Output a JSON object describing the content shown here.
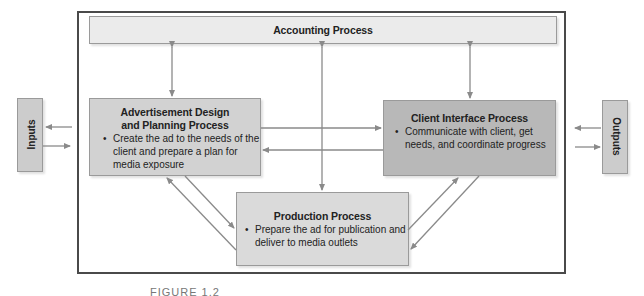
{
  "diagram": {
    "colors": {
      "frame": "#4a4a4a",
      "accounting_fill": "#ebebeb",
      "advertisement_fill": "#d2d2d2",
      "client_fill": "#b8b8b8",
      "production_fill": "#dadada",
      "io_fill": "#cccccc",
      "arrow": "#8a8a8a"
    },
    "inputs": {
      "label": "Inputs"
    },
    "outputs": {
      "label": "Outputs"
    },
    "accounting": {
      "title": "Accounting Process"
    },
    "advertisement": {
      "title_line1": "Advertisement Design",
      "title_line2": "and Planning Process",
      "bullet": "•",
      "lines": [
        "Create the ad to the needs of the",
        "client and prepare a plan for",
        "media exposure"
      ]
    },
    "client": {
      "title": "Client Interface Process",
      "bullet": "•",
      "lines": [
        "Communicate with client, get",
        "needs, and coordinate progress"
      ]
    },
    "production": {
      "title": "Production Process",
      "bullet": "•",
      "lines": [
        "Prepare the ad for publication and",
        "deliver to media outlets"
      ]
    },
    "caption": "FIGURE 1.2"
  }
}
